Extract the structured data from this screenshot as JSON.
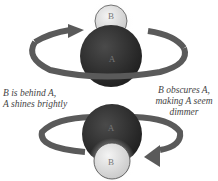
{
  "diagram": {
    "top": {
      "star_a_label": "A",
      "star_b_label": "B",
      "caption": "B is behind A,",
      "caption_line2": "A shines brightly"
    },
    "bottom": {
      "star_a_label": "A",
      "star_b_label": "B",
      "caption": "B obscures A,",
      "caption_line2": "making A seem",
      "caption_line3": "dimmer"
    },
    "colors": {
      "star_a": "#2e2e2e",
      "star_b": "#e4e4e4",
      "arrow": "#555555"
    }
  }
}
